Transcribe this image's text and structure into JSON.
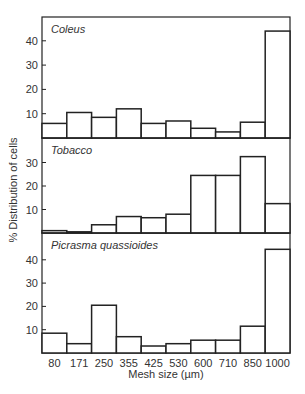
{
  "chart_data": {
    "type": "bar",
    "layout": "three stacked histogram panels sharing x-axis",
    "xlabel": "Mesh size (µm)",
    "ylabel": "% Distribution of cells",
    "categories": [
      "80",
      "171",
      "250",
      "355",
      "425",
      "530",
      "600",
      "710",
      "850",
      "1000"
    ],
    "grid": false,
    "series": [
      {
        "name": "Coleus",
        "values": [
          6,
          10.5,
          8.5,
          12,
          6,
          7,
          4,
          2.5,
          6.5,
          44
        ],
        "yticks": [
          10,
          20,
          30,
          40
        ],
        "ylim": [
          0,
          49
        ]
      },
      {
        "name": "Tobacco",
        "values": [
          1,
          0.5,
          3.5,
          7,
          6.5,
          8,
          24.5,
          24.5,
          32.5,
          12.5
        ],
        "yticks": [
          10,
          20,
          30
        ],
        "ylim": [
          0,
          39
        ]
      },
      {
        "name": "Picrasma quassioides",
        "values": [
          8.5,
          4,
          20.5,
          7,
          3,
          4,
          5.5,
          5.5,
          11.5,
          44.5
        ],
        "yticks": [
          10,
          20,
          30,
          40
        ],
        "ylim": [
          0,
          50
        ]
      }
    ]
  },
  "colors": {
    "line": "#222222",
    "text": "#333333",
    "fill": "#ffffff"
  }
}
